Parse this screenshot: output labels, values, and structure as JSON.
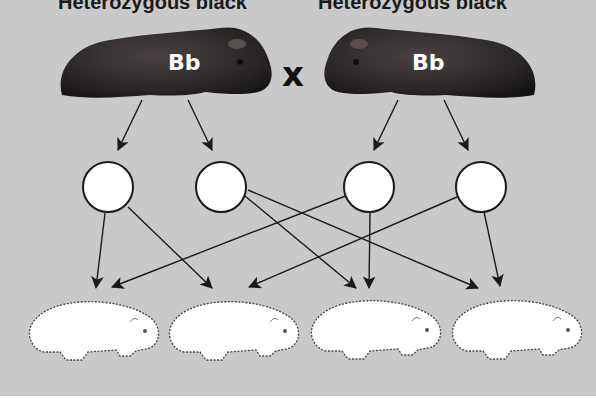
{
  "parents": {
    "left": {
      "label": "Heterozygous black",
      "genotype": "Bb"
    },
    "right": {
      "label": "Heterozygous black",
      "genotype": "Bb"
    },
    "cross_symbol": "x"
  },
  "gametes": [
    {
      "id": "g1",
      "label": ""
    },
    {
      "id": "g2",
      "label": ""
    },
    {
      "id": "g3",
      "label": ""
    },
    {
      "id": "g4",
      "label": ""
    }
  ],
  "offspring": [
    {
      "id": "o1",
      "label": ""
    },
    {
      "id": "o2",
      "label": ""
    },
    {
      "id": "o3",
      "label": ""
    },
    {
      "id": "o4",
      "label": ""
    }
  ],
  "colors": {
    "background": "#c9c9c9",
    "parent_fur": "#2b2b2b",
    "gamete_fill": "#ffffff",
    "offspring_fill": "#ffffff",
    "arrow": "#1a1a1a"
  }
}
